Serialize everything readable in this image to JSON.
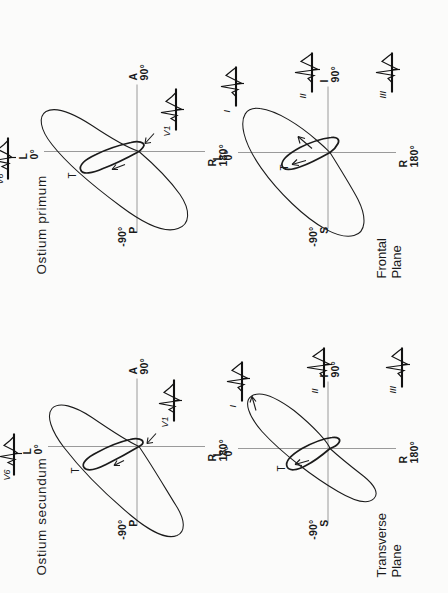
{
  "figure": {
    "kind": "vectorcardiogram-loop-plate"
  },
  "columns": [
    {
      "id": "secundum",
      "title": "Ostium  secundum"
    },
    {
      "id": "primum",
      "title": "Ostium  primum"
    }
  ],
  "rows": [
    {
      "id": "transverse",
      "label_line1": "Transverse",
      "label_line2": "Plane"
    },
    {
      "id": "frontal",
      "label_line1": "Frontal",
      "label_line2": "Plane"
    }
  ],
  "panels": {
    "secundum_transverse": {
      "plane": "Transverse Plane",
      "diagnosis": "Ostium  secundum",
      "axis_labels": {
        "left": {
          "degrees": "-90°",
          "letter": "P"
        },
        "right": {
          "letter": "A",
          "degrees": "90°"
        },
        "top": {
          "letter": "L",
          "degrees": "0°"
        },
        "bottom": {
          "letter": "R",
          "degrees": "180°"
        }
      },
      "loop_labels": [
        "T"
      ],
      "ecg_leads": [
        {
          "name": "V6"
        },
        {
          "name": "V1"
        }
      ]
    },
    "primum_transverse": {
      "plane": "Transverse Plane",
      "diagnosis": "Ostium  primum",
      "axis_labels": {
        "left": {
          "degrees": "-90°",
          "letter": "P"
        },
        "right": {
          "letter": "A",
          "degrees": "90°"
        },
        "top": {
          "letter": "L",
          "degrees": "0°"
        },
        "bottom": {
          "letter": "R",
          "degrees": "180°"
        }
      },
      "loop_labels": [
        "T"
      ],
      "ecg_leads": [
        {
          "name": "V6"
        },
        {
          "name": "V1"
        }
      ]
    },
    "secundum_frontal": {
      "plane": "Frontal Plane",
      "diagnosis": "Ostium  secundum",
      "axis_labels": {
        "left": {
          "degrees": "-90°",
          "letter": "S"
        },
        "right": {
          "letter": "I",
          "degrees": "90°"
        },
        "top": {
          "letter": "L",
          "degrees": "0°"
        },
        "bottom": {
          "letter": "R",
          "degrees": "180°"
        }
      },
      "loop_labels": [
        "T"
      ],
      "ecg_leads": [
        {
          "name": "I"
        },
        {
          "name": "II"
        },
        {
          "name": "III"
        }
      ]
    },
    "primum_frontal": {
      "plane": "Frontal Plane",
      "diagnosis": "Ostium  primum",
      "axis_labels": {
        "left": {
          "degrees": "-90°",
          "letter": "S"
        },
        "right": {
          "letter": "I",
          "degrees": "90°"
        },
        "top": {
          "letter": "L",
          "degrees": "0°"
        },
        "bottom": {
          "letter": "R",
          "degrees": "180°"
        }
      },
      "loop_labels": [
        "T"
      ],
      "ecg_leads": [
        {
          "name": "I"
        },
        {
          "name": "II"
        },
        {
          "name": "III"
        }
      ]
    }
  },
  "colors": {
    "ink": "#1b1b1b",
    "axis": "#9a9a9a",
    "background": "#fbfbfa"
  }
}
